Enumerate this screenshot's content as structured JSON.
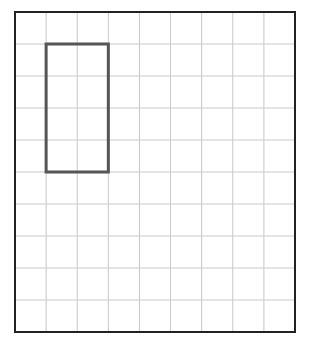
{
  "grid": {
    "columns": 9,
    "rows": 10,
    "left": 15,
    "top": 12,
    "width": 280,
    "height": 320,
    "line_color": "#c8c8c8",
    "border_color": "#222222"
  },
  "rectangle": {
    "col_start": 1,
    "col_end": 3,
    "row_start": 1,
    "row_end": 5,
    "stroke_color": "#555555",
    "stroke_width": 3
  }
}
